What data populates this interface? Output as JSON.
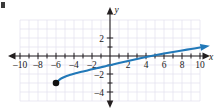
{
  "figure": {
    "name": "coordinate-plane-graph",
    "background_color": "#ffffff",
    "grid_color": "#e2e0ee",
    "axis_color": "#231f20",
    "curve_color": "#2178b8"
  },
  "chart_data": {
    "type": "line",
    "title": "",
    "subtitle": "",
    "xlabel": "x",
    "ylabel": "y",
    "xlim": [
      -11,
      11
    ],
    "ylim": [
      -5,
      3
    ],
    "grid": true,
    "legend": null,
    "x_ticks": [
      -10,
      -8,
      -6,
      -4,
      -2,
      2,
      4,
      6,
      8,
      10
    ],
    "x_tick_labels": [
      "–10",
      "–8",
      "–6",
      "–4",
      "–2",
      "2",
      "4",
      "6",
      "8",
      "10"
    ],
    "y_ticks": [
      2,
      -2,
      -4
    ],
    "y_tick_labels": [
      "2",
      "–2",
      "–4"
    ],
    "grid_spacing": 1,
    "series": [
      {
        "name": "radical-curve",
        "color": "#2178b8",
        "style": "solid",
        "start_marker": "closed-dot",
        "end_marker": "arrow",
        "points": [
          [
            -6,
            -3.0
          ],
          [
            -5.5,
            -2.55
          ],
          [
            -5,
            -2.3
          ],
          [
            -4.5,
            -2.12
          ],
          [
            -4,
            -1.97
          ],
          [
            -3.5,
            -1.84
          ],
          [
            -3,
            -1.72
          ],
          [
            -2.5,
            -1.6
          ],
          [
            -2,
            -1.48
          ],
          [
            -1.5,
            -1.37
          ],
          [
            -1,
            -1.25
          ],
          [
            -0.5,
            -1.13
          ],
          [
            0,
            -1.02
          ],
          [
            1,
            -0.78
          ],
          [
            2,
            -0.55
          ],
          [
            3,
            -0.33
          ],
          [
            4,
            -0.12
          ],
          [
            5,
            0.08
          ],
          [
            6,
            0.27
          ],
          [
            7,
            0.45
          ],
          [
            8,
            0.62
          ],
          [
            9,
            0.78
          ],
          [
            10,
            0.95
          ]
        ]
      }
    ],
    "annotations": [
      {
        "name": "endpoint-dot",
        "x": -6,
        "y": -3.0,
        "kind": "closed-circle"
      },
      {
        "name": "curve-arrowhead",
        "x": 10,
        "y": 0.95,
        "kind": "arrowhead"
      }
    ]
  }
}
